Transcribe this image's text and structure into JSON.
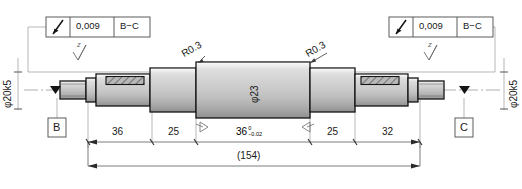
{
  "drawing": {
    "title": "stepped-shaft-engineering-drawing",
    "overall_dimension": "(154)",
    "line_color": "#1a1a1a",
    "shade_light": "#e8e8e8",
    "shade_mid": "#c8c8c8",
    "shade_dark": "#a8a8a8",
    "thin_line_color": "#9a9a9a"
  },
  "feature_control_frames": [
    {
      "id": "fcf-left",
      "symbol": "runout-symbol",
      "tolerance": "0,009",
      "datums": "B−C"
    },
    {
      "id": "fcf-right",
      "symbol": "runout-symbol",
      "tolerance": "0,009",
      "datums": "B−C"
    }
  ],
  "datums": [
    {
      "id": "datum-b",
      "label": "B"
    },
    {
      "id": "datum-c",
      "label": "C"
    }
  ],
  "diameter_labels": [
    {
      "id": "dia-left",
      "text": "φ20k5"
    },
    {
      "id": "dia-center",
      "text": "φ23"
    },
    {
      "id": "dia-right",
      "text": "φ20k5"
    }
  ],
  "radius_callouts": [
    {
      "id": "radius-left",
      "text": "R0.3"
    },
    {
      "id": "radius-right",
      "text": "R0.3"
    }
  ],
  "surface_finish": [
    {
      "id": "surface-finish-left",
      "text": "z"
    },
    {
      "id": "surface-finish-right",
      "text": "z"
    }
  ],
  "dimensions": [
    {
      "id": "dim-1",
      "value": "36",
      "tol_upper": "",
      "tol_lower": ""
    },
    {
      "id": "dim-2",
      "value": "25",
      "tol_upper": "",
      "tol_lower": ""
    },
    {
      "id": "dim-3",
      "value": "36",
      "tol_upper": "0",
      "tol_lower": "−0.02"
    },
    {
      "id": "dim-4",
      "value": "25",
      "tol_upper": "",
      "tol_lower": ""
    },
    {
      "id": "dim-5",
      "value": "32",
      "tol_upper": "",
      "tol_lower": ""
    }
  ]
}
